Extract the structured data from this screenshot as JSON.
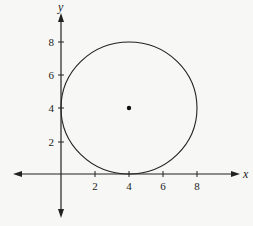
{
  "figure": {
    "x_axis_label": "x",
    "y_axis_label": "y",
    "x_ticks": [
      {
        "value": 2,
        "label": "2",
        "px": 95
      },
      {
        "value": 4,
        "label": "4",
        "px": 129
      },
      {
        "value": 6,
        "label": "6",
        "px": 163
      },
      {
        "value": 8,
        "label": "8",
        "px": 197
      }
    ],
    "y_ticks": [
      {
        "value": 2,
        "label": "2",
        "py": 142
      },
      {
        "value": 4,
        "label": "4",
        "py": 108
      },
      {
        "value": 6,
        "label": "6",
        "py": 75
      },
      {
        "value": 8,
        "label": "8",
        "py": 42
      }
    ],
    "circle": {
      "center": [
        4,
        4
      ],
      "radius": 4
    },
    "center_point": [
      4,
      4
    ],
    "colors": {
      "ink": "#222222",
      "background": "#f7f7f5"
    }
  }
}
